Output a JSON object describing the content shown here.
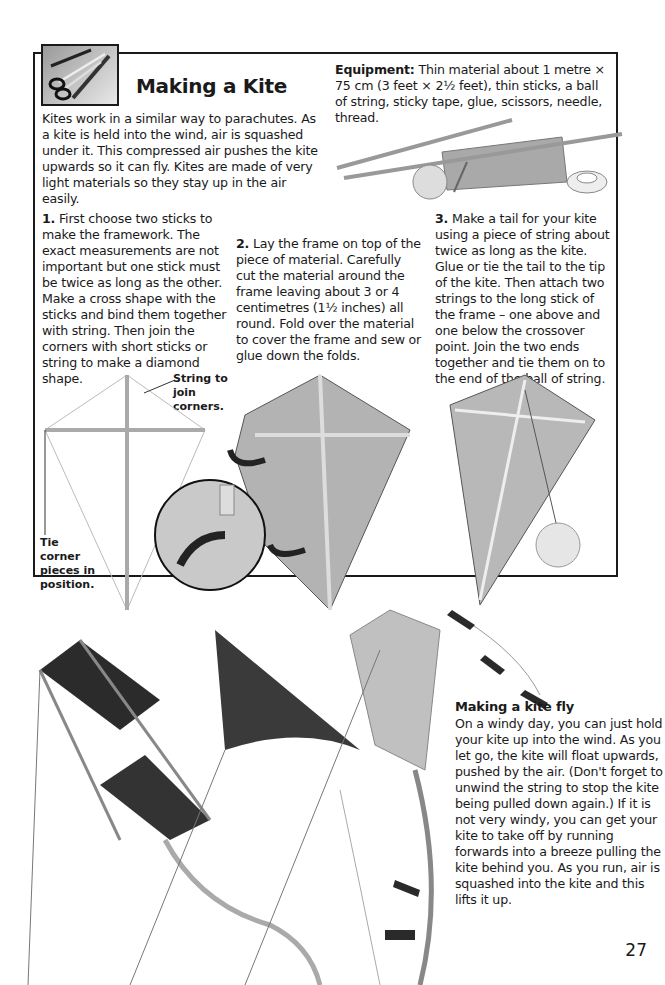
{
  "page": {
    "title": "Making a Kite",
    "page_number": "27",
    "intro": "Kites work in a similar way to parachutes. As a kite is held into the wind, air is squashed under it. This compressed air pushes the kite upwards so it can fly. Kites are made of very light materials so they stay up in the air easily.",
    "equipment": {
      "label": "Equipment:",
      "text": "Thin material about 1 metre × 75 cm (3 feet × 2½ feet), thin sticks, a ball of string, sticky tape, glue, scissors, needle, thread."
    },
    "steps": [
      {
        "number": "1.",
        "text": "First choose two sticks to make the framework. The exact measurements are not important but one stick must be twice as long as the other. Make a cross shape with the sticks and bind them together with string. Then join the corners with short sticks or string to make a diamond shape."
      },
      {
        "number": "2.",
        "text": "Lay the frame on top of the piece of material. Carefully cut the material around the frame leaving about 3 or 4 centimetres (1½ inches) all round. Fold over the material to cover the frame and sew or glue down the folds."
      },
      {
        "number": "3.",
        "text": "Make a tail for your kite using a piece of string about twice as long as the kite. Glue or tie the tail to the tip of the kite. Then attach two strings to the long stick of the frame – one above and one below the crossover point. Join the two ends together and tie them on to the end of the ball of string."
      }
    ],
    "labels": {
      "string_to_join": "String to join corners.",
      "tie_corner": "Tie corner pieces in position.",
      "glue": "Glue"
    },
    "fly_section": {
      "heading": "Making a kite fly",
      "text": "On a windy day, you can just hold your kite up into the wind. As you let go, the kite will float upwards, pushed by the air. (Don't forget to unwind the string to stop the kite being pulled down again.) If it is not very windy, you can get your kite to take off by running forwards into a breeze pulling the kite behind you. As you run, air is squashed into the kite and this lifts it up."
    },
    "icons": [
      "scissors-pencil-icon"
    ],
    "colors": {
      "ink": "#1a1a1a",
      "material": "#b8b8b8",
      "dark_kite": "#2b2b2b"
    }
  }
}
